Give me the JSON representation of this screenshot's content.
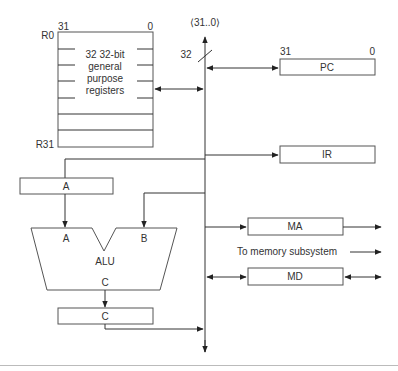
{
  "bus": {
    "label": "⟨31..0⟩",
    "width_label": "32"
  },
  "register_file": {
    "msb": "31",
    "lsb": "0",
    "first_reg": "R0",
    "last_reg": "R31",
    "desc_lines": [
      "32 32-bit",
      "general",
      "purpose",
      "registers"
    ]
  },
  "pc": {
    "msb": "31",
    "lsb": "0",
    "label": "PC"
  },
  "ir": {
    "label": "IR"
  },
  "a_reg": {
    "label": "A"
  },
  "alu": {
    "label": "ALU",
    "input_a": "A",
    "input_b": "B",
    "output": "C"
  },
  "c_reg": {
    "label": "C"
  },
  "ma": {
    "label": "MA"
  },
  "md": {
    "label": "MD"
  },
  "memory_note": "To memory subsystem",
  "colors": {
    "line": "#333333",
    "box_stroke": "#555555",
    "text": "#333333",
    "footer_rule": "#bbbbbb"
  }
}
